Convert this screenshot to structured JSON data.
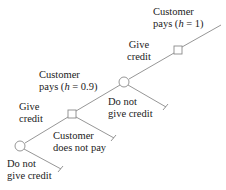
{
  "diagram": {
    "type": "decision-tree",
    "colors": {
      "line": "#8a8a8a",
      "node_fill": "#ffffff",
      "node_stroke": "#8a8a8a",
      "text": "#222222"
    },
    "nodes": [
      {
        "id": "decision-1",
        "shape": "circle",
        "x": 20,
        "y": 146
      },
      {
        "id": "chance-1",
        "shape": "square",
        "x": 72,
        "y": 114
      },
      {
        "id": "decision-2",
        "shape": "circle",
        "x": 124,
        "y": 82
      },
      {
        "id": "chance-2",
        "shape": "square",
        "x": 178,
        "y": 50
      }
    ],
    "labels": {
      "top_customer_pays_line1": "Customer",
      "top_customer_pays_line2_prefix": "pays (",
      "top_customer_pays_h": "h",
      "top_customer_pays_line2_suffix": " = 1)",
      "give_credit_2_line1": "Give",
      "give_credit_2_line2": "credit",
      "mid_customer_pays_line1": "Customer",
      "mid_customer_pays_line2_prefix": "pays (",
      "mid_customer_pays_h": "h",
      "mid_customer_pays_line2_suffix": " = 0.9)",
      "do_not_give_credit_2_line1": "Do not",
      "do_not_give_credit_2_line2": "give credit",
      "give_credit_1_line1": "Give",
      "give_credit_1_line2": "credit",
      "customer_does_not_pay_line1": "Customer",
      "customer_does_not_pay_line2": "does not pay",
      "do_not_give_credit_1_line1": "Do not",
      "do_not_give_credit_1_line2": "give credit"
    }
  }
}
